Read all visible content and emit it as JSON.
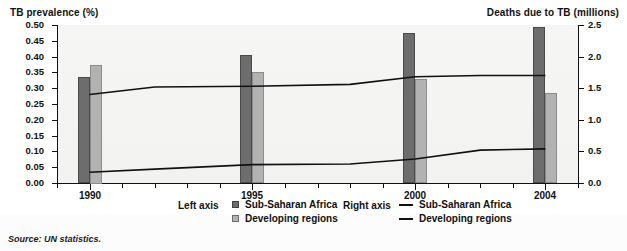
{
  "figure": {
    "left_axis_title": "TB prevalence (%)",
    "right_axis_title": "Deaths due to TB (millions)",
    "source_note": "Source: UN statistics."
  },
  "legend": {
    "left_axis_label": "Left axis",
    "right_axis_label": "Right axis",
    "left_items": [
      {
        "label": "Sub-Saharan Africa",
        "marker": "square-dark",
        "color": "#6d6d6d"
      },
      {
        "label": "Developing regions",
        "marker": "square-light",
        "color": "#b2b2b2"
      }
    ],
    "right_items": [
      {
        "label": "Sub-Saharan Africa",
        "marker": "line",
        "color": "#111111"
      },
      {
        "label": "Developing regions",
        "marker": "line",
        "color": "#111111"
      }
    ]
  },
  "colors": {
    "bar_dark": "#6d6d6d",
    "bar_light": "#b2b2b2",
    "line": "#111111",
    "plot_background": "#f4f4f2",
    "axis": "#111111"
  },
  "chart_data": {
    "type": "bar",
    "title": "",
    "subtitle": "",
    "xlabel": "",
    "ylabel": "TB prevalence (%)",
    "y2label": "Deaths due to TB (millions)",
    "grid": false,
    "legend_position": "bottom",
    "categories": [
      "1990",
      "1995",
      "2000",
      "2004"
    ],
    "x": [
      1990,
      1995,
      2000,
      2004
    ],
    "xlim": [
      1989,
      2005
    ],
    "ylim": [
      0.0,
      0.5
    ],
    "y2lim": [
      0.0,
      2.5
    ],
    "ytick_labels": [
      "0.00",
      "0.05",
      "0.10",
      "0.15",
      "0.20",
      "0.25",
      "0.30",
      "0.35",
      "0.40",
      "0.45",
      "0.50"
    ],
    "ytick_values": [
      0.0,
      0.05,
      0.1,
      0.15,
      0.2,
      0.25,
      0.3,
      0.35,
      0.4,
      0.45,
      0.5
    ],
    "y2tick_labels": [
      "0.0",
      "0.5",
      "1.0",
      "1.5",
      "2.0",
      "2.5"
    ],
    "y2tick_values": [
      0.0,
      0.5,
      1.0,
      1.5,
      2.0,
      2.5
    ],
    "xtick_labels": [
      "1990",
      "1995",
      "2000",
      "2004"
    ],
    "bar_series": [
      {
        "name": "Sub-Saharan Africa",
        "axis": "left",
        "color": "#6d6d6d",
        "values": [
          0.335,
          0.405,
          0.475,
          0.495
        ]
      },
      {
        "name": "Developing regions",
        "axis": "left",
        "color": "#b2b2b2",
        "values": [
          0.375,
          0.352,
          0.328,
          0.285
        ]
      }
    ],
    "line_series": [
      {
        "name": "Sub-Saharan Africa",
        "axis": "right",
        "color": "#111111",
        "x": [
          1990,
          1992,
          1995,
          1998,
          2000,
          2002,
          2004
        ],
        "values": [
          1.4,
          1.52,
          1.53,
          1.56,
          1.68,
          1.7,
          1.7
        ]
      },
      {
        "name": "Developing regions",
        "axis": "right",
        "color": "#111111",
        "x": [
          1990,
          1992,
          1995,
          1998,
          2000,
          2002,
          2004
        ],
        "values": [
          0.17,
          0.22,
          0.29,
          0.3,
          0.38,
          0.52,
          0.54
        ]
      }
    ]
  }
}
